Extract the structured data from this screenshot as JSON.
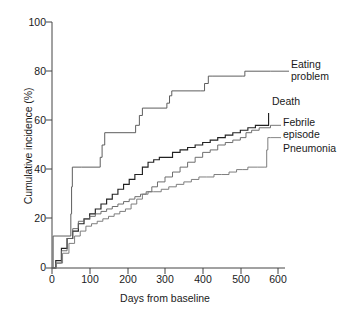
{
  "chart_data": {
    "type": "line",
    "subtype": "step",
    "title": "",
    "xlabel": "Days from baseline",
    "ylabel": "Cumulative incidence (%)",
    "xlim": [
      0,
      600
    ],
    "ylim": [
      0,
      100
    ],
    "xticks": [
      0,
      100,
      200,
      300,
      400,
      500,
      600
    ],
    "yticks": [
      0,
      20,
      40,
      60,
      80,
      100
    ],
    "grid": false,
    "legend_position": "right-inline-labels",
    "series": [
      {
        "name": "Eating problem",
        "color": "#555555",
        "final_value": 80,
        "points": [
          [
            0,
            0
          ],
          [
            3,
            13
          ],
          [
            48,
            13
          ],
          [
            50,
            22
          ],
          [
            52,
            33
          ],
          [
            54,
            41
          ],
          [
            78,
            41
          ],
          [
            125,
            41
          ],
          [
            128,
            45
          ],
          [
            133,
            50
          ],
          [
            140,
            55
          ],
          [
            215,
            55
          ],
          [
            222,
            58
          ],
          [
            232,
            62
          ],
          [
            240,
            65
          ],
          [
            300,
            65
          ],
          [
            305,
            67
          ],
          [
            312,
            70
          ],
          [
            318,
            72
          ],
          [
            395,
            72
          ],
          [
            405,
            75
          ],
          [
            415,
            78
          ],
          [
            425,
            78
          ],
          [
            505,
            78
          ],
          [
            512,
            80
          ],
          [
            580,
            80
          ]
        ]
      },
      {
        "name": "Death",
        "color": "#222222",
        "final_value": 63,
        "points": [
          [
            0,
            0
          ],
          [
            10,
            3
          ],
          [
            25,
            8
          ],
          [
            40,
            12
          ],
          [
            55,
            15
          ],
          [
            70,
            18
          ],
          [
            85,
            20
          ],
          [
            100,
            22
          ],
          [
            115,
            24
          ],
          [
            130,
            26
          ],
          [
            145,
            28
          ],
          [
            160,
            30
          ],
          [
            175,
            32
          ],
          [
            190,
            34
          ],
          [
            205,
            36
          ],
          [
            220,
            38
          ],
          [
            240,
            41
          ],
          [
            255,
            43
          ],
          [
            270,
            44
          ],
          [
            285,
            45
          ],
          [
            300,
            45
          ],
          [
            320,
            47
          ],
          [
            340,
            48
          ],
          [
            360,
            49
          ],
          [
            380,
            50
          ],
          [
            400,
            51
          ],
          [
            420,
            52
          ],
          [
            440,
            53
          ],
          [
            460,
            54
          ],
          [
            480,
            55
          ],
          [
            500,
            56
          ],
          [
            520,
            57
          ],
          [
            540,
            58
          ],
          [
            560,
            58
          ],
          [
            572,
            58
          ],
          [
            575,
            63
          ]
        ]
      },
      {
        "name": "Febrile episode",
        "color": "#666666",
        "final_value": 58,
        "points": [
          [
            0,
            0
          ],
          [
            10,
            2
          ],
          [
            25,
            7
          ],
          [
            40,
            12
          ],
          [
            55,
            16
          ],
          [
            70,
            19
          ],
          [
            85,
            20
          ],
          [
            100,
            21
          ],
          [
            115,
            22
          ],
          [
            130,
            23
          ],
          [
            145,
            24
          ],
          [
            160,
            25
          ],
          [
            175,
            26
          ],
          [
            190,
            27
          ],
          [
            205,
            28
          ],
          [
            220,
            29
          ],
          [
            235,
            30
          ],
          [
            250,
            31
          ],
          [
            265,
            33
          ],
          [
            280,
            35
          ],
          [
            300,
            37
          ],
          [
            320,
            39
          ],
          [
            340,
            41
          ],
          [
            360,
            43
          ],
          [
            380,
            45
          ],
          [
            400,
            47
          ],
          [
            420,
            48
          ],
          [
            440,
            50
          ],
          [
            460,
            51
          ],
          [
            480,
            52
          ],
          [
            500,
            53
          ],
          [
            515,
            55
          ],
          [
            530,
            56
          ],
          [
            550,
            57
          ],
          [
            580,
            58
          ]
        ]
      },
      {
        "name": "Pneumonia",
        "color": "#777777",
        "final_value": 53,
        "points": [
          [
            0,
            0
          ],
          [
            12,
            2
          ],
          [
            28,
            6
          ],
          [
            45,
            10
          ],
          [
            60,
            13
          ],
          [
            75,
            15
          ],
          [
            90,
            17
          ],
          [
            105,
            18
          ],
          [
            120,
            19
          ],
          [
            135,
            20
          ],
          [
            150,
            21
          ],
          [
            165,
            22
          ],
          [
            180,
            23
          ],
          [
            195,
            24
          ],
          [
            210,
            26
          ],
          [
            225,
            28
          ],
          [
            240,
            30
          ],
          [
            255,
            31
          ],
          [
            270,
            31
          ],
          [
            290,
            32
          ],
          [
            310,
            33
          ],
          [
            330,
            34
          ],
          [
            350,
            35
          ],
          [
            370,
            36
          ],
          [
            390,
            37
          ],
          [
            410,
            37
          ],
          [
            430,
            38
          ],
          [
            450,
            38
          ],
          [
            470,
            39
          ],
          [
            490,
            40
          ],
          [
            505,
            40
          ],
          [
            520,
            41
          ],
          [
            545,
            41
          ],
          [
            565,
            41
          ],
          [
            570,
            48
          ],
          [
            573,
            53
          ],
          [
            580,
            53
          ]
        ]
      }
    ],
    "annotations": [
      {
        "label": "Eating\nproblem",
        "series": "Eating problem"
      },
      {
        "label": "Death",
        "series": "Death"
      },
      {
        "label": "Febrile\nepisode",
        "series": "Febrile episode"
      },
      {
        "label": "Pneumonia",
        "series": "Pneumonia"
      }
    ]
  },
  "axes": {
    "xlabel": "Days from baseline",
    "ylabel": "Cumulative incidence (%)",
    "xticks": [
      "0",
      "100",
      "200",
      "300",
      "400",
      "500",
      "600"
    ],
    "yticks": [
      "0",
      "20",
      "40",
      "60",
      "80",
      "100"
    ]
  },
  "legend": {
    "eating_problem": "Eating\nproblem",
    "death": "Death",
    "febrile_episode": "Febrile\nepisode",
    "pneumonia": "Pneumonia"
  },
  "colors": {
    "axis": "#444444",
    "eating_problem": "#555555",
    "death": "#222222",
    "febrile_episode": "#666666",
    "pneumonia": "#777777",
    "text": "#1a1a1a",
    "background": "#ffffff"
  }
}
